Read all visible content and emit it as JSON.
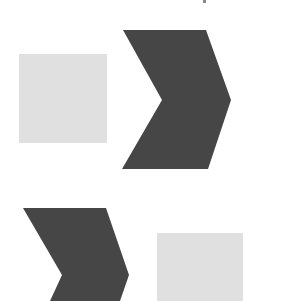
{
  "diagram": {
    "canvas": {
      "width": 281,
      "height": 301,
      "background": "#ffffff"
    },
    "colors": {
      "chevron": "#464646",
      "square": "#e0e0e0",
      "artifact": "#8a8a8a"
    },
    "groups": [
      {
        "name": "top-row",
        "order": [
          "square",
          "chevron"
        ],
        "square": {
          "x": 19,
          "y": 54,
          "width": 88,
          "height": 89
        },
        "chevron": {
          "points": "123,30 206,30 231,100 208,169 122,169 162,100",
          "direction": "right"
        }
      },
      {
        "name": "bottom-row",
        "order": [
          "chevron",
          "square"
        ],
        "chevron": {
          "points": "23,208 106,208 129,275 120,301 50,301 62,275",
          "direction": "right"
        },
        "square": {
          "x": 157,
          "y": 233,
          "width": 86,
          "height": 68
        }
      }
    ],
    "artifact": {
      "x": 203,
      "y": 0,
      "width": 3,
      "height": 3
    }
  }
}
